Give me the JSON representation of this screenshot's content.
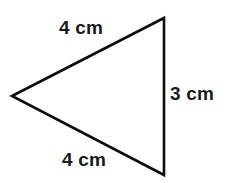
{
  "figure": {
    "name": "isosceles-triangle-with-side-lengths",
    "shape": "triangle",
    "background_color": "#ffffff",
    "stroke_color": "#0d0d0d",
    "stroke_width": 2.6,
    "text_color": "#1a1a1a",
    "vertices": [
      {
        "name": "left-vertex",
        "x": 12,
        "y": 96
      },
      {
        "name": "top-right-vertex",
        "x": 164,
        "y": 18
      },
      {
        "name": "bottom-right-vertex",
        "x": 164,
        "y": 175
      }
    ],
    "polygon_points": "12,96 164,18 164,175",
    "labels": {
      "top": "4 cm",
      "right": "3 cm",
      "bottom": "4 cm"
    }
  }
}
